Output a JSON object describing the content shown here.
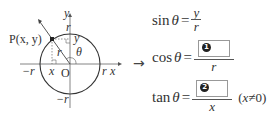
{
  "diagram": {
    "point_label": "P(x, y)",
    "axis_x": "x",
    "axis_y": "y",
    "origin": "O",
    "radius": "r",
    "neg_r_x": "−r",
    "pos_r_x": "r",
    "pos_r_y": "r",
    "neg_r_y": "−r",
    "foot_x": "x",
    "side_y": "y",
    "hyp_r": "r",
    "angle": "θ"
  },
  "arrow": "→",
  "equations": {
    "sin": {
      "fn": "sin",
      "var": "θ",
      "equals": "=",
      "numerator": "y",
      "denominator": "r"
    },
    "cos": {
      "fn": "cos",
      "var": "θ",
      "equals": "=",
      "blank_number": "1",
      "denominator": "r"
    },
    "tan": {
      "fn": "tan",
      "var": "θ",
      "equals": "=",
      "blank_number": "2",
      "denominator": "x",
      "condition_open": "(",
      "condition_var": "x",
      "condition_rest": "≠0)"
    }
  },
  "colors": {
    "circle": "#333333",
    "axis": "#555555",
    "box_border": "#999999",
    "badge": "#222222"
  }
}
